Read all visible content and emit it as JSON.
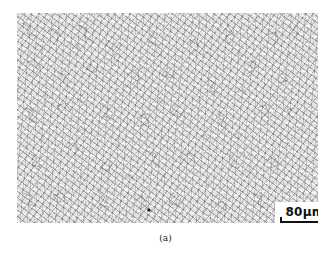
{
  "figure": {
    "image_description": "Optical micrograph of fine-grained polycrystalline microstructure with grain boundaries",
    "scale_bar": {
      "label": "80μm"
    },
    "caption": "(a)"
  }
}
